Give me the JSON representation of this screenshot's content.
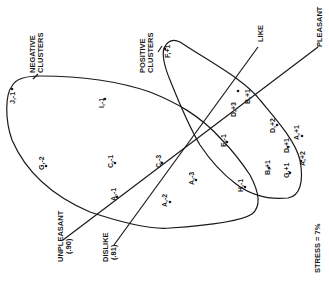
{
  "diagram": {
    "labels": {
      "negative_clusters": [
        "NEGATIVE",
        "CLUSTERS"
      ],
      "positive_clusters": [
        "POSITIVE",
        "CLUSTERS"
      ],
      "like": "LIKE",
      "pleasant": "PLEASANT",
      "unpleasant": [
        "UNPLEASANT",
        "(.90)"
      ],
      "dislike": [
        "DISLIKE",
        "(.81)"
      ],
      "stress": "STRESS = 7%"
    },
    "negative_points": [
      {
        "label": "J,-1"
      },
      {
        "label": "I,-1"
      },
      {
        "label": "G,-2"
      },
      {
        "label": "C,-1"
      },
      {
        "label": "C,-3"
      },
      {
        "label": "A,-1"
      },
      {
        "label": "A,-2"
      },
      {
        "label": "A,-3"
      },
      {
        "label": "E,-1"
      },
      {
        "label": "H,-1"
      }
    ],
    "positive_points": [
      {
        "label": "F,+1"
      },
      {
        "label": "D,+3"
      },
      {
        "label": "B,+1"
      },
      {
        "label": "D,+2"
      },
      {
        "label": "D,+1"
      },
      {
        "label": "A,+1"
      },
      {
        "label": "B,+1"
      },
      {
        "label": "G,+1"
      },
      {
        "label": "A,+2"
      }
    ]
  }
}
